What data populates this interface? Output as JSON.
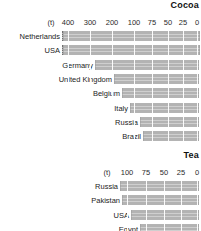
{
  "chart_data": [
    {
      "type": "bar",
      "title": "Cocoa",
      "orientation": "horizontal-reversed",
      "unit_label": "(t)",
      "xlabel": "",
      "ylabel": "",
      "tick_labels": [
        "400",
        "300",
        "200",
        "100",
        "75",
        "50",
        "25",
        "0"
      ],
      "tick_values": [
        400,
        300,
        200,
        100,
        75,
        50,
        25,
        0
      ],
      "axis_note": "Scale is broken: 400-100 compressed, 100-0 expanded",
      "categories": [
        "Netherlands",
        "USA",
        "Germany",
        "United Kingdom",
        "Belgium",
        "Italy",
        "Russia",
        "Brazil"
      ],
      "values": [
        450,
        440,
        225,
        150,
        120,
        95,
        78,
        68
      ],
      "clipped": [
        true,
        true,
        false,
        false,
        false,
        false,
        false,
        false
      ],
      "grid": true,
      "legend": "none"
    },
    {
      "type": "bar",
      "title": "Tea",
      "orientation": "horizontal-reversed",
      "unit_label": "(t)",
      "xlabel": "",
      "ylabel": "",
      "tick_labels": [
        "100",
        "75",
        "50",
        "25",
        "0"
      ],
      "tick_values": [
        100,
        75,
        50,
        25,
        0
      ],
      "axis_note": "Linear 100 to 0, right to left",
      "categories": [
        "Russia",
        "Pakistan",
        "USA",
        "Egypt"
      ],
      "values": [
        118,
        112,
        90,
        76
      ],
      "clipped": [
        false,
        false,
        false,
        false
      ],
      "grid": true,
      "legend": "none"
    }
  ],
  "cocoa": {
    "title": "Cocoa",
    "unit": "(t)",
    "ticks": [
      {
        "label": "(t)",
        "x": 51
      },
      {
        "label": "400",
        "x": 68
      },
      {
        "label": "300",
        "x": 90
      },
      {
        "label": "200",
        "x": 112
      },
      {
        "label": "100",
        "x": 134
      },
      {
        "label": "75",
        "x": 152
      },
      {
        "label": "50",
        "x": 168
      },
      {
        "label": "25",
        "x": 183
      },
      {
        "label": "0",
        "x": 197
      }
    ],
    "rows": [
      {
        "label": "Netherlands",
        "left": 62,
        "clipped": true
      },
      {
        "label": "USA",
        "left": 62,
        "clipped": true
      },
      {
        "label": "Germany",
        "left": 95,
        "clipped": false
      },
      {
        "label": "United Kingdom",
        "left": 114,
        "clipped": false
      },
      {
        "label": "Belgium",
        "left": 122,
        "clipped": false
      },
      {
        "label": "Italy",
        "left": 130,
        "clipped": false
      },
      {
        "label": "Russia",
        "left": 140,
        "clipped": false
      },
      {
        "label": "Brazil",
        "left": 143,
        "clipped": false
      }
    ]
  },
  "tea": {
    "title": "Tea",
    "unit": "(t)",
    "ticks": [
      {
        "label": "(t)",
        "x": 107
      },
      {
        "label": "100",
        "x": 127
      },
      {
        "label": "75",
        "x": 146
      },
      {
        "label": "50",
        "x": 164
      },
      {
        "label": "25",
        "x": 181
      },
      {
        "label": "0",
        "x": 197
      }
    ],
    "rows": [
      {
        "label": "Russia",
        "left": 120,
        "clipped": false
      },
      {
        "label": "Pakistan",
        "left": 122,
        "clipped": false
      },
      {
        "label": "USA",
        "left": 131,
        "clipped": false
      },
      {
        "label": "Egypt",
        "left": 140,
        "clipped": false
      }
    ]
  }
}
